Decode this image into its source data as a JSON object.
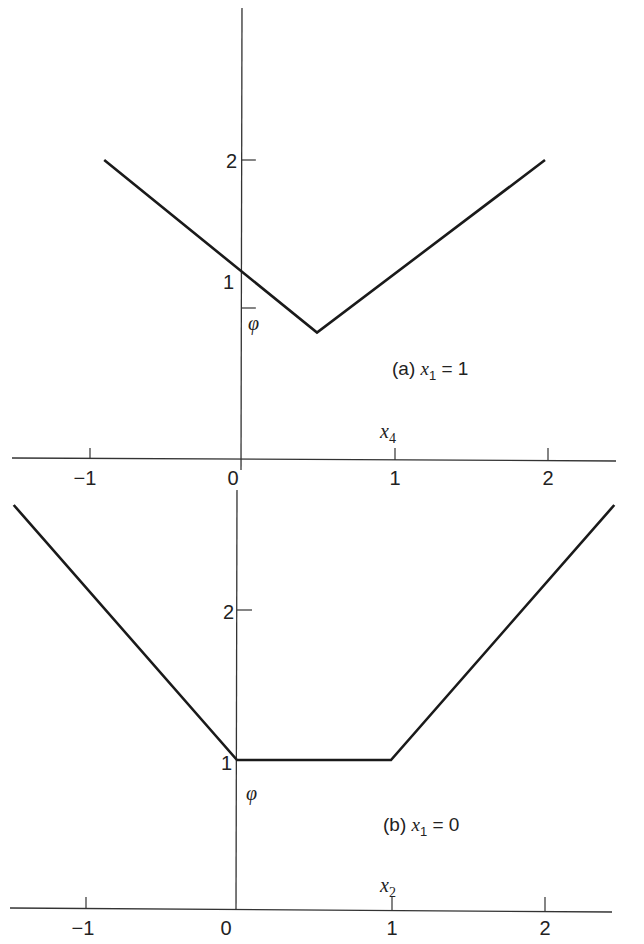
{
  "chart_data": [
    {
      "type": "line",
      "panel": "a",
      "title": "(a) x1 = 1",
      "annotation": "(a)",
      "condition": {
        "var": "x",
        "sub": "1",
        "op": "=",
        "value": "1"
      },
      "xlabel": {
        "var": "x",
        "sub": "4"
      },
      "ylabel": "φ",
      "xticks": [
        "-1",
        "0",
        "1",
        "2"
      ],
      "yticks": [
        "1",
        "2"
      ],
      "xlim": [
        -1.5,
        2.5
      ],
      "ylim": [
        0,
        3
      ],
      "grid": false,
      "series": [
        {
          "name": "phi",
          "x": [
            -0.9,
            0.5,
            2.0
          ],
          "y": [
            2.0,
            0.55,
            2.0
          ]
        }
      ]
    },
    {
      "type": "line",
      "panel": "b",
      "title": "(b) x1 = 0",
      "annotation": "(b)",
      "condition": {
        "var": "x",
        "sub": "1",
        "op": "=",
        "value": "0"
      },
      "xlabel": {
        "var": "x",
        "sub": "2"
      },
      "ylabel": "φ",
      "xticks": [
        "-1",
        "0",
        "1",
        "2"
      ],
      "yticks": [
        "1",
        "2"
      ],
      "xlim": [
        -1.5,
        2.5
      ],
      "ylim": [
        0,
        3
      ],
      "grid": false,
      "series": [
        {
          "name": "phi",
          "x": [
            -1.45,
            0.0,
            1.0,
            2.45
          ],
          "y": [
            2.7,
            1.0,
            1.0,
            2.7
          ]
        }
      ]
    }
  ]
}
